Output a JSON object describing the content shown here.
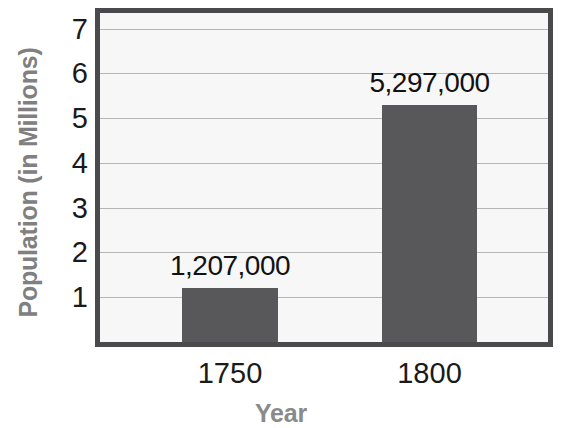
{
  "chart_data": {
    "type": "bar",
    "title": "",
    "subtitle": "",
    "xlabel": "Year",
    "ylabel": "Population (in Millions)",
    "categories": [
      "1750",
      "1800"
    ],
    "values": [
      1.207,
      5.297
    ],
    "data_labels": [
      "1,207,000",
      "5,297,000"
    ],
    "series": [
      {
        "name": "Population",
        "values": [
          1.207,
          5.297
        ]
      }
    ],
    "ylim": [
      0,
      7.35
    ],
    "yticks": [
      1,
      2,
      3,
      4,
      5,
      6,
      7
    ],
    "ytick_labels": [
      "1",
      "2",
      "3",
      "4",
      "5",
      "6",
      "7"
    ],
    "grid": "horizontal",
    "legend": "none",
    "colors": {
      "bar": "#58585a",
      "plot_background": "#f7f7f7",
      "plot_border": "#4a4a4c",
      "gridline": "#b6b6b6",
      "axis_title": "#808080",
      "tick_label": "#1a1a1a",
      "data_label": "#111111",
      "page_background": "#ffffff"
    }
  }
}
